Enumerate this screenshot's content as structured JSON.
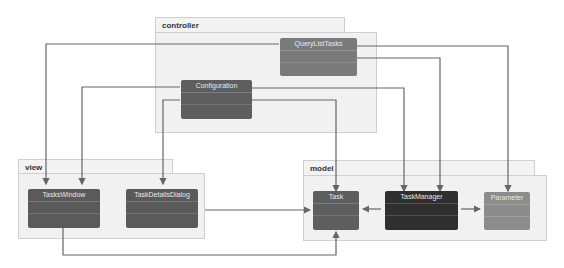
{
  "packages": {
    "controller": {
      "label": "controller"
    },
    "view": {
      "label": "view"
    },
    "model": {
      "label": "model"
    }
  },
  "classes": {
    "query_list_tasks": {
      "label": "QueryListTasks",
      "color": "#7a7a7a"
    },
    "configuration": {
      "label": "Configuration",
      "color": "#5e5e5e"
    },
    "tasks_window": {
      "label": "TasksWindow",
      "color": "#5a5a5a"
    },
    "task_details_dialog": {
      "label": "TaskDetailsDialog",
      "color": "#5a5a5a"
    },
    "task": {
      "label": "Task",
      "color": "#5e5e5e"
    },
    "task_manager": {
      "label": "TaskManager",
      "color": "#2f2f2f"
    },
    "parameter": {
      "label": "Parameter",
      "color": "#8c8c8c"
    }
  },
  "colors": {
    "line": "#666666",
    "package_fill": "#f1f1f1",
    "package_border": "#cfcfcf"
  },
  "relations": [
    {
      "from": "QueryListTasks",
      "to": "TasksWindow"
    },
    {
      "from": "QueryListTasks",
      "to": "TaskManager"
    },
    {
      "from": "QueryListTasks",
      "to": "Parameter"
    },
    {
      "from": "Configuration",
      "to": "TasksWindow"
    },
    {
      "from": "Configuration",
      "to": "TaskDetailsDialog"
    },
    {
      "from": "Configuration",
      "to": "Task"
    },
    {
      "from": "Configuration",
      "to": "TaskManager"
    },
    {
      "from": "TaskDetailsDialog",
      "to": "Task"
    },
    {
      "from": "TasksWindow",
      "to": "Task"
    },
    {
      "from": "TaskManager",
      "to": "Task"
    },
    {
      "from": "TaskManager",
      "to": "Parameter"
    }
  ]
}
